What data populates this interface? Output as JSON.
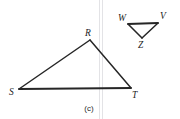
{
  "figure": {
    "caption": "(c)",
    "background_color": "#ffffff",
    "stroke_color": "#262626",
    "label_color": "#1d1d1d",
    "scan_line_color": "#e3e3e6",
    "large_triangle": {
      "name": "triangle-RST",
      "vertices": [
        {
          "label": "R",
          "x": 90,
          "y": 40,
          "label_x": 85,
          "label_y": 36
        },
        {
          "label": "S",
          "x": 19,
          "y": 89,
          "label_x": 9,
          "label_y": 95
        },
        {
          "label": "T",
          "x": 131,
          "y": 88,
          "label_x": 132,
          "label_y": 98
        }
      ],
      "edges": [
        {
          "name": "edge-SR",
          "from": "S",
          "to": "R",
          "stroke_width": 1.5
        },
        {
          "name": "edge-RT",
          "from": "R",
          "to": "T",
          "stroke_width": 1.5
        },
        {
          "name": "edge-ST",
          "from": "S",
          "to": "T",
          "stroke_width": 1.8
        }
      ]
    },
    "small_triangle": {
      "name": "triangle-WVZ",
      "vertices": [
        {
          "label": "W",
          "x": 128,
          "y": 24,
          "label_x": 118,
          "label_y": 21
        },
        {
          "label": "V",
          "x": 158,
          "y": 23,
          "label_x": 160,
          "label_y": 19
        },
        {
          "label": "Z",
          "x": 142,
          "y": 38,
          "label_x": 138,
          "label_y": 48
        }
      ],
      "edges": [
        {
          "name": "edge-WV",
          "from": "W",
          "to": "V",
          "stroke_width": 1.8
        },
        {
          "name": "edge-VZ",
          "from": "V",
          "to": "Z",
          "stroke_width": 1.5
        },
        {
          "name": "edge-ZW",
          "from": "Z",
          "to": "W",
          "stroke_width": 1.5
        }
      ]
    },
    "caption_position": {
      "x": 89,
      "y": 111
    },
    "scan_lines": [
      {
        "name": "scan-line-left",
        "x": 99.5,
        "y1": 0,
        "y2": 119
      },
      {
        "name": "scan-line-right",
        "x": 102.5,
        "y1": 0,
        "y2": 119
      }
    ]
  }
}
